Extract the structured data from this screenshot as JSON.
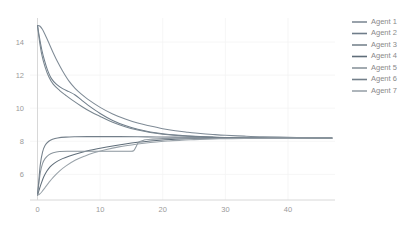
{
  "chart_data": {
    "type": "line",
    "title": "",
    "xlabel": "",
    "ylabel": "",
    "xlim": [
      -1.2,
      47.5
    ],
    "ylim": [
      4.45,
      15.45
    ],
    "xticks": [
      0,
      10,
      20,
      30,
      40
    ],
    "xtick_labels": [
      "0",
      "10",
      "20",
      "30",
      "40"
    ],
    "yticks": [
      6,
      8,
      10,
      12,
      14
    ],
    "ytick_labels": [
      "6",
      "8",
      "10",
      "12",
      "14"
    ],
    "grid": true,
    "legend_position": "right",
    "consensus_value": 8.2,
    "legend": [
      "Agent 1",
      "Agent 2",
      "Agent 3",
      "Agent 4",
      "Agent 5",
      "Agent 6",
      "Agent 7"
    ],
    "colors": [
      "#7f8b96",
      "#6f7d8a",
      "#78858f",
      "#5f6d79",
      "#8b959d",
      "#737f8a",
      "#9aa3aa"
    ],
    "series": [
      {
        "name": "Agent 1",
        "color": "#7f8b96",
        "x": [
          0,
          0.4,
          0.8,
          1.2,
          1.8,
          2.5,
          3.2,
          4,
          5,
          6,
          7,
          8,
          10,
          12,
          14,
          16,
          18,
          20,
          22,
          24,
          26,
          28,
          30,
          33,
          36,
          40,
          44,
          47
        ],
        "y": [
          15.0,
          14.95,
          14.75,
          14.45,
          13.95,
          13.35,
          12.8,
          12.25,
          11.65,
          11.2,
          10.85,
          10.55,
          10.05,
          9.65,
          9.35,
          9.1,
          8.92,
          8.76,
          8.64,
          8.55,
          8.47,
          8.41,
          8.36,
          8.31,
          8.27,
          8.24,
          8.22,
          8.21
        ]
      },
      {
        "name": "Agent 2",
        "color": "#6f7d8a",
        "x": [
          0,
          0.3,
          0.7,
          1.1,
          1.6,
          2.2,
          3,
          4,
          5,
          6,
          7,
          8,
          10,
          12,
          14,
          16,
          18,
          20,
          22,
          24,
          26,
          28,
          30,
          33,
          36,
          40,
          44,
          47
        ],
        "y": [
          15.0,
          14.3,
          13.5,
          12.9,
          12.3,
          11.8,
          11.45,
          11.18,
          11.0,
          10.8,
          10.5,
          10.2,
          9.68,
          9.26,
          8.95,
          8.72,
          8.56,
          8.45,
          8.37,
          8.32,
          8.28,
          8.25,
          8.23,
          8.22,
          8.21,
          8.21,
          8.2,
          8.2
        ]
      },
      {
        "name": "Agent 3",
        "color": "#78858f",
        "x": [
          0,
          0.3,
          0.7,
          1.2,
          1.8,
          2.5,
          3.5,
          4.5,
          5.5,
          7,
          8.5,
          10,
          12,
          14,
          16,
          18,
          20,
          22,
          24,
          26,
          28,
          30,
          33,
          36,
          40,
          44,
          47
        ],
        "y": [
          15.0,
          14.1,
          13.2,
          12.5,
          11.9,
          11.45,
          11.08,
          10.78,
          10.5,
          10.12,
          9.78,
          9.5,
          9.15,
          8.88,
          8.68,
          8.53,
          8.43,
          8.36,
          8.31,
          8.27,
          8.25,
          8.23,
          8.21,
          8.21,
          8.2,
          8.2,
          8.2
        ]
      },
      {
        "name": "Agent 4",
        "color": "#5f6d79",
        "x": [
          0,
          0.25,
          0.6,
          1.0,
          1.5,
          2,
          2.6,
          3.2,
          4,
          5,
          6,
          8,
          10,
          12,
          14,
          16,
          18,
          20,
          22,
          24,
          26,
          28,
          30,
          33,
          36,
          40,
          44,
          47
        ],
        "y": [
          4.75,
          5.05,
          5.45,
          5.85,
          6.2,
          6.45,
          6.65,
          6.8,
          6.95,
          7.1,
          7.22,
          7.42,
          7.58,
          7.72,
          7.84,
          7.94,
          8.02,
          8.08,
          8.12,
          8.15,
          8.17,
          8.18,
          8.19,
          8.2,
          8.2,
          8.2,
          8.2,
          8.2
        ]
      },
      {
        "name": "Agent 5",
        "color": "#8b959d",
        "x": [
          0,
          0.2,
          0.45,
          0.8,
          1.2,
          1.8,
          2.5,
          3.5,
          5,
          7,
          9,
          11,
          13,
          15,
          15.4,
          15.8,
          16.2,
          17,
          18,
          20,
          22,
          24,
          26,
          28,
          30,
          33,
          36,
          40,
          44,
          47
        ],
        "y": [
          4.75,
          5.4,
          6.1,
          6.65,
          6.95,
          7.18,
          7.3,
          7.38,
          7.4,
          7.4,
          7.4,
          7.4,
          7.4,
          7.4,
          7.45,
          7.72,
          7.96,
          8.07,
          8.12,
          8.16,
          8.18,
          8.19,
          8.19,
          8.2,
          8.2,
          8.2,
          8.2,
          8.2,
          8.2,
          8.2
        ]
      },
      {
        "name": "Agent 6",
        "color": "#737f8a",
        "x": [
          0,
          0.2,
          0.45,
          0.8,
          1.2,
          1.8,
          2.4,
          3.2,
          4.5,
          6,
          8,
          10,
          13,
          16,
          19,
          22,
          25,
          28,
          30,
          33,
          36,
          40,
          44,
          47
        ],
        "y": [
          4.75,
          5.6,
          6.6,
          7.35,
          7.75,
          8.0,
          8.12,
          8.2,
          8.25,
          8.27,
          8.28,
          8.28,
          8.28,
          8.27,
          8.26,
          8.25,
          8.24,
          8.23,
          8.22,
          8.22,
          8.21,
          8.21,
          8.2,
          8.2
        ]
      },
      {
        "name": "Agent 7",
        "color": "#9aa3aa",
        "x": [
          0,
          0.3,
          0.7,
          1.2,
          1.8,
          2.5,
          3.5,
          4.5,
          6,
          7.5,
          9,
          11,
          13,
          15,
          17,
          19,
          21,
          23,
          25,
          27,
          29,
          31,
          34,
          37,
          40,
          44,
          47
        ],
        "y": [
          4.75,
          4.8,
          4.95,
          5.2,
          5.5,
          5.82,
          6.2,
          6.5,
          6.85,
          7.1,
          7.3,
          7.5,
          7.66,
          7.78,
          7.88,
          7.96,
          8.02,
          8.07,
          8.1,
          8.13,
          8.15,
          8.16,
          8.18,
          8.19,
          8.19,
          8.2,
          8.2
        ]
      }
    ]
  }
}
